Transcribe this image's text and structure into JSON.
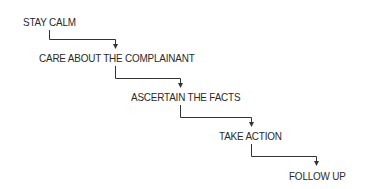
{
  "diagram": {
    "type": "staircase-flow",
    "steps": [
      {
        "label": "STAY CALM"
      },
      {
        "label": "CARE ABOUT THE COMPLAINANT"
      },
      {
        "label": "ASCERTAIN THE FACTS"
      },
      {
        "label": "TAKE ACTION"
      },
      {
        "label": "FOLLOW UP"
      }
    ],
    "connectors": [
      {
        "from": "STAY CALM",
        "to": "CARE ABOUT THE COMPLAINANT"
      },
      {
        "from": "CARE ABOUT THE COMPLAINANT",
        "to": "ASCERTAIN THE FACTS"
      },
      {
        "from": "ASCERTAIN THE FACTS",
        "to": "TAKE ACTION"
      },
      {
        "from": "TAKE ACTION",
        "to": "FOLLOW UP"
      }
    ],
    "colors": {
      "text": "#2a2a2a",
      "line": "#333333",
      "background": "#ffffff"
    }
  }
}
